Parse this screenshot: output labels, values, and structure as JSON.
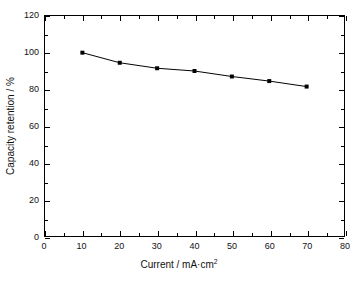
{
  "chart_data": {
    "type": "line",
    "title": "",
    "xlabel": "Current / mA·cm",
    "xlabel_sup": "2",
    "ylabel": "Capacity retention / %",
    "xlim": [
      0,
      80
    ],
    "ylim": [
      0,
      120
    ],
    "x_major_ticks": [
      0,
      10,
      20,
      30,
      40,
      50,
      60,
      70,
      80
    ],
    "y_major_ticks": [
      0,
      20,
      40,
      60,
      80,
      100,
      120
    ],
    "x_minor_interval": 5,
    "y_minor_interval": 10,
    "grid": false,
    "legend": false,
    "x": [
      10,
      20,
      30,
      40,
      50,
      60,
      70
    ],
    "values": [
      100,
      94.5,
      91.5,
      90,
      87,
      84.5,
      81.5
    ],
    "series": [
      {
        "name": "Capacity retention",
        "x": [
          10,
          20,
          30,
          40,
          50,
          60,
          70
        ],
        "values": [
          100,
          94.5,
          91.5,
          90,
          87,
          84.5,
          81.5
        ],
        "color": "#000000",
        "marker": "square",
        "line_style": "solid"
      }
    ],
    "x_tick_labels": [
      "0",
      "10",
      "20",
      "30",
      "40",
      "50",
      "60",
      "70",
      "80"
    ],
    "y_tick_labels": [
      "0",
      "20",
      "40",
      "60",
      "80",
      "100",
      "120"
    ]
  },
  "style": {
    "frame_color": "#000000",
    "background": "#ffffff",
    "text_color": "#111111"
  }
}
